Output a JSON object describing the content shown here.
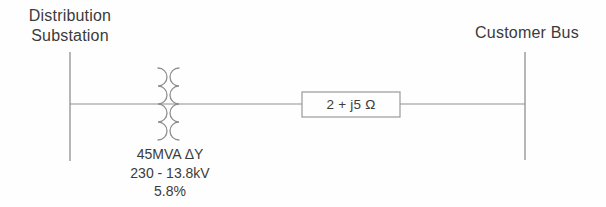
{
  "diagram": {
    "source_bus": {
      "label_line1": "Distribution",
      "label_line2": "Substation"
    },
    "customer_bus": {
      "label": "Customer Bus"
    },
    "transformer": {
      "rating": "45MVA ΔY",
      "voltage": "230 - 13.8kV",
      "impedance": "5.8%"
    },
    "series_impedance": {
      "label": "2 + j5 Ω"
    },
    "colors": {
      "line": "#8f8f8f",
      "text": "#3b3b3b",
      "box_border": "#999999",
      "background": "#fefefe"
    }
  }
}
